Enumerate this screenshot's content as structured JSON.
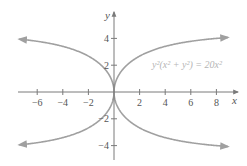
{
  "chart_data": {
    "type": "line",
    "title": "",
    "equation": "y²(x² + y²) = 20x²",
    "xlabel": "x",
    "ylabel": "y",
    "xlim": [
      -7.4,
      9.6
    ],
    "ylim": [
      -5.0,
      5.7
    ],
    "xticks": [
      -6,
      -4,
      -2,
      2,
      4,
      6,
      8
    ],
    "xtick_labels": [
      "−6",
      "−4",
      "−2",
      "2",
      "4",
      "6",
      "8"
    ],
    "yticks": [
      4,
      2,
      -2,
      -4
    ],
    "ytick_labels": [
      "4",
      "2",
      "−2",
      "−4"
    ],
    "grid": false,
    "series": [
      {
        "name": "upper branch",
        "relation": "y = sqrt((-x^2 + sqrt(x^4 + 80x^2))/2)",
        "x_range": [
          -7.4,
          8.9
        ],
        "asymptote": "y = √20 ≈ 4.47"
      },
      {
        "name": "lower branch",
        "relation": "y = -sqrt((-x^2 + sqrt(x^4 + 80x^2))/2)",
        "x_range": [
          -7.4,
          8.9
        ],
        "asymptote": "y = -√20 ≈ -4.47"
      }
    ],
    "annotations": [
      {
        "text": "y²(x² + y²) = 20x²",
        "position": "right"
      }
    ]
  }
}
